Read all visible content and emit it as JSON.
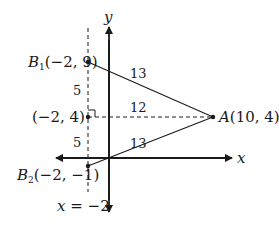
{
  "diagram": {
    "axes": {
      "x_label": "x",
      "y_label": "y"
    },
    "vertical_line_label": "x = −2",
    "points": {
      "B1": {
        "letter": "B",
        "sub": "1",
        "coords": "(−2, 9)"
      },
      "M": {
        "coords": "(−2, 4)"
      },
      "B2": {
        "letter": "B",
        "sub": "2",
        "coords": "(−2, −1)"
      },
      "A": {
        "letter": "A",
        "coords": "(10, 4)"
      }
    },
    "segment_labels": {
      "B1A": "13",
      "MA": "12",
      "B2A": "13",
      "B1M": "5",
      "MB2": "5"
    },
    "colors": {
      "ink": "#1a1a1a",
      "background": "#ffffff"
    }
  }
}
